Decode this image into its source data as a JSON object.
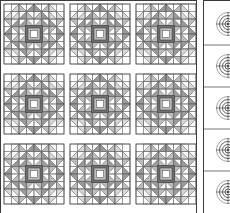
{
  "document": {
    "title": "Quilt Block Layout Diagram",
    "type": "quilt-pattern-schematic"
  },
  "colors": {
    "background": "#ffffff",
    "fabric_light": "#ffffff",
    "fabric_mid_light": "#d8d8d8",
    "fabric_mid": "#bdbdbd",
    "fabric_dark": "#9a9a9a",
    "fabric_darkest": "#6e6e6e",
    "outline": "#3a3a3a",
    "grid_line": "#7a7a7a",
    "sashing": "#ffffff"
  },
  "quilt_panel": {
    "name": "feathered-star-block-grid",
    "rows": 3,
    "columns": 3,
    "block_count": 9,
    "block_size_px": 60,
    "sashing_px": 6,
    "panel_width_px": 197,
    "panel_height_px": 213,
    "block_grid_units": 8,
    "block_name": "feathered-star",
    "blocks": [
      {
        "row": 1,
        "col": 1,
        "x": 4,
        "y": 4
      },
      {
        "row": 1,
        "col": 2,
        "x": 70,
        "y": 4
      },
      {
        "row": 1,
        "col": 3,
        "x": 136,
        "y": 4
      },
      {
        "row": 2,
        "col": 1,
        "x": 4,
        "y": 74
      },
      {
        "row": 2,
        "col": 2,
        "x": 70,
        "y": 74
      },
      {
        "row": 2,
        "col": 3,
        "x": 136,
        "y": 74
      },
      {
        "row": 3,
        "col": 1,
        "x": 4,
        "y": 144
      },
      {
        "row": 3,
        "col": 2,
        "x": 70,
        "y": 144
      },
      {
        "row": 3,
        "col": 3,
        "x": 136,
        "y": 144
      }
    ]
  },
  "border_panel": {
    "name": "circular-motif-border-strip",
    "motif_count": 5,
    "motif_name": "concentric-spiral-medallion",
    "strip_width_px": 27,
    "cell_height_px": 42,
    "rings": 4,
    "motifs": [
      {
        "index": 1,
        "cy": 24
      },
      {
        "index": 2,
        "cy": 66
      },
      {
        "index": 3,
        "cy": 108
      },
      {
        "index": 4,
        "cy": 150
      },
      {
        "index": 5,
        "cy": 192
      }
    ]
  }
}
